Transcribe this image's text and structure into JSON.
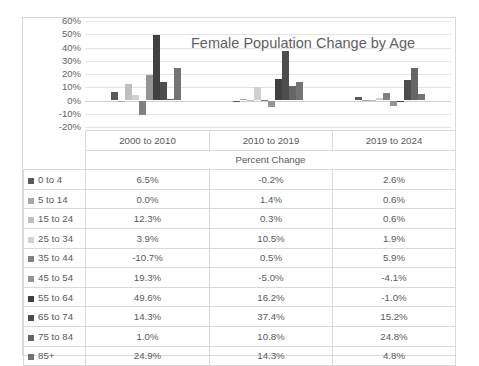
{
  "chart_data": {
    "type": "bar",
    "title": "Female Population Change by Age",
    "xlabel": "Percent Change",
    "ylabel": "",
    "ylim": [
      -20,
      60
    ],
    "ytick_labels": [
      "60%",
      "50%",
      "40%",
      "30%",
      "20%",
      "10%",
      "0%",
      "-10%",
      "-20%"
    ],
    "ytick_values": [
      60,
      50,
      40,
      30,
      20,
      10,
      0,
      -10,
      -20
    ],
    "grid": true,
    "legend_position": "table-first-column",
    "categories": [
      "2000 to 2010",
      "2010 to 2019",
      "2019 to 2024"
    ],
    "series": [
      {
        "name": "0 to 4",
        "color": "#595959",
        "values": [
          6.5,
          -0.2,
          2.6
        ]
      },
      {
        "name": "5 to 14",
        "color": "#a6a6a6",
        "values": [
          0.0,
          1.4,
          0.6
        ]
      },
      {
        "name": "15 to 24",
        "color": "#bfbfbf",
        "values": [
          12.3,
          0.3,
          0.6
        ]
      },
      {
        "name": "25 to 34",
        "color": "#d0d0d0",
        "values": [
          3.9,
          10.5,
          1.9
        ]
      },
      {
        "name": "35 to 44",
        "color": "#808080",
        "values": [
          -10.7,
          0.5,
          5.9
        ]
      },
      {
        "name": "45 to 54",
        "color": "#949494",
        "values": [
          19.3,
          -5.0,
          -4.1
        ]
      },
      {
        "name": "55 to 64",
        "color": "#404040",
        "values": [
          49.6,
          16.2,
          -1.0
        ]
      },
      {
        "name": "65 to 74",
        "color": "#4d4d4d",
        "values": [
          14.3,
          37.4,
          15.2
        ]
      },
      {
        "name": "75 to 84",
        "color": "#666666",
        "values": [
          1.0,
          10.8,
          24.8
        ]
      },
      {
        "name": "85+",
        "color": "#737373",
        "values": [
          24.9,
          14.3,
          4.8
        ]
      }
    ]
  },
  "table": {
    "column_headers": [
      "",
      "2000 to 2010",
      "2010 to 2019",
      "2019 to 2024"
    ],
    "subheader": "Percent Change",
    "rows": [
      {
        "label": "0 to 4",
        "color": "#595959",
        "values": [
          "6.5%",
          "-0.2%",
          "2.6%"
        ]
      },
      {
        "label": "5 to 14",
        "color": "#a6a6a6",
        "values": [
          "0.0%",
          "1.4%",
          "0.6%"
        ]
      },
      {
        "label": "15 to 24",
        "color": "#bfbfbf",
        "values": [
          "12.3%",
          "0.3%",
          "0.6%"
        ]
      },
      {
        "label": "25 to 34",
        "color": "#d0d0d0",
        "values": [
          "3.9%",
          "10.5%",
          "1.9%"
        ]
      },
      {
        "label": "35 to 44",
        "color": "#808080",
        "values": [
          "-10.7%",
          "0.5%",
          "5.9%"
        ]
      },
      {
        "label": "45 to 54",
        "color": "#949494",
        "values": [
          "19.3%",
          "-5.0%",
          "-4.1%"
        ]
      },
      {
        "label": "55 to 64",
        "color": "#404040",
        "values": [
          "49.6%",
          "16.2%",
          "-1.0%"
        ]
      },
      {
        "label": "65 to 74",
        "color": "#4d4d4d",
        "values": [
          "14.3%",
          "37.4%",
          "15.2%"
        ]
      },
      {
        "label": "75 to 84",
        "color": "#666666",
        "values": [
          "1.0%",
          "10.8%",
          "24.8%"
        ]
      },
      {
        "label": "85+",
        "color": "#737373",
        "values": [
          "24.9%",
          "14.3%",
          "4.8%"
        ]
      }
    ]
  }
}
